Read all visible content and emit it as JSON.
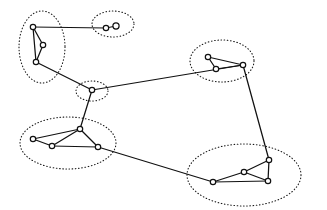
{
  "figure": {
    "title": "",
    "type": "cluster-graph-diagram",
    "width": 327,
    "height": 210,
    "background_color": "#ffffff",
    "stroke_color": "#111111",
    "node_fill_color": "#ffffff",
    "boundary_style": "dotted"
  },
  "clusters": [
    {
      "id": "cluster-top-left",
      "label": "",
      "cx": 42,
      "cy": 47,
      "rx": 23,
      "ry": 36,
      "rotation": 0,
      "node_count": 3
    },
    {
      "id": "cluster-top-pair",
      "label": "",
      "cx": 113,
      "cy": 24,
      "rx": 21,
      "ry": 13,
      "rotation": 0,
      "node_count": 2
    },
    {
      "id": "cluster-top-right",
      "label": "",
      "cx": 222,
      "cy": 61,
      "rx": 32,
      "ry": 21,
      "rotation": 0,
      "node_count": 3
    },
    {
      "id": "cluster-center",
      "label": "",
      "cx": 92,
      "cy": 91,
      "rx": 16,
      "ry": 10,
      "rotation": 0,
      "node_count": 1
    },
    {
      "id": "cluster-bottom-left",
      "label": "",
      "cx": 68,
      "cy": 143,
      "rx": 48,
      "ry": 26,
      "rotation": 0,
      "node_count": 4
    },
    {
      "id": "cluster-bottom-right",
      "label": "",
      "cx": 244,
      "cy": 175,
      "rx": 57,
      "ry": 31,
      "rotation": 0,
      "node_count": 4
    }
  ],
  "nodes": [
    {
      "id": "n1",
      "cluster": "cluster-top-left",
      "cx": 33,
      "cy": 27,
      "r": 2.7
    },
    {
      "id": "n2",
      "cluster": "cluster-top-left",
      "cx": 43,
      "cy": 45,
      "r": 2.7
    },
    {
      "id": "n3",
      "cluster": "cluster-top-left",
      "cx": 36,
      "cy": 62,
      "r": 2.7
    },
    {
      "id": "n4",
      "cluster": "cluster-top-pair",
      "cx": 106,
      "cy": 28,
      "r": 2.7
    },
    {
      "id": "n5",
      "cluster": "cluster-top-pair",
      "cx": 116,
      "cy": 26,
      "r": 3.1
    },
    {
      "id": "n6",
      "cluster": "cluster-top-right",
      "cx": 208,
      "cy": 57,
      "r": 2.7
    },
    {
      "id": "n7",
      "cluster": "cluster-top-right",
      "cx": 216,
      "cy": 69,
      "r": 2.7
    },
    {
      "id": "n8",
      "cluster": "cluster-top-right",
      "cx": 243,
      "cy": 65,
      "r": 2.7
    },
    {
      "id": "n9",
      "cluster": "cluster-center",
      "cx": 92,
      "cy": 90,
      "r": 2.7
    },
    {
      "id": "n10",
      "cluster": "cluster-bottom-left",
      "cx": 33,
      "cy": 139,
      "r": 2.7
    },
    {
      "id": "n11",
      "cluster": "cluster-bottom-left",
      "cx": 52,
      "cy": 146,
      "r": 2.7
    },
    {
      "id": "n12",
      "cluster": "cluster-bottom-left",
      "cx": 80,
      "cy": 129,
      "r": 2.7
    },
    {
      "id": "n13",
      "cluster": "cluster-bottom-left",
      "cx": 98,
      "cy": 147,
      "r": 2.7
    },
    {
      "id": "n14",
      "cluster": "cluster-bottom-right",
      "cx": 213,
      "cy": 182,
      "r": 2.7
    },
    {
      "id": "n15",
      "cluster": "cluster-bottom-right",
      "cx": 244,
      "cy": 172,
      "r": 2.7
    },
    {
      "id": "n16",
      "cluster": "cluster-bottom-right",
      "cx": 268,
      "cy": 181,
      "r": 2.7
    },
    {
      "id": "n17",
      "cluster": "cluster-bottom-right",
      "cx": 269,
      "cy": 160,
      "r": 2.7
    }
  ],
  "edges": [
    {
      "id": "e1",
      "from": "n1",
      "to": "n2",
      "kind": "intra"
    },
    {
      "id": "e2",
      "from": "n2",
      "to": "n3",
      "kind": "intra"
    },
    {
      "id": "e3",
      "from": "n1",
      "to": "n3",
      "kind": "intra"
    },
    {
      "id": "e4",
      "from": "n4",
      "to": "n5",
      "kind": "intra"
    },
    {
      "id": "e5",
      "from": "n6",
      "to": "n7",
      "kind": "intra"
    },
    {
      "id": "e6",
      "from": "n7",
      "to": "n8",
      "kind": "intra"
    },
    {
      "id": "e7",
      "from": "n6",
      "to": "n8",
      "kind": "intra"
    },
    {
      "id": "e8",
      "from": "n10",
      "to": "n11",
      "kind": "intra"
    },
    {
      "id": "e9",
      "from": "n11",
      "to": "n13",
      "kind": "intra"
    },
    {
      "id": "e10",
      "from": "n10",
      "to": "n12",
      "kind": "intra"
    },
    {
      "id": "e11",
      "from": "n11",
      "to": "n12",
      "kind": "intra"
    },
    {
      "id": "e12",
      "from": "n12",
      "to": "n13",
      "kind": "intra"
    },
    {
      "id": "e13",
      "from": "n14",
      "to": "n15",
      "kind": "intra"
    },
    {
      "id": "e14",
      "from": "n15",
      "to": "n16",
      "kind": "intra"
    },
    {
      "id": "e15",
      "from": "n14",
      "to": "n16",
      "kind": "intra"
    },
    {
      "id": "e16",
      "from": "n15",
      "to": "n17",
      "kind": "intra"
    },
    {
      "id": "e17",
      "from": "n16",
      "to": "n17",
      "kind": "intra"
    },
    {
      "id": "e18",
      "from": "n1",
      "to": "n4",
      "kind": "inter"
    },
    {
      "id": "e19",
      "from": "n3",
      "to": "n9",
      "kind": "inter"
    },
    {
      "id": "e20",
      "from": "n9",
      "to": "n8",
      "kind": "inter"
    },
    {
      "id": "e21",
      "from": "n9",
      "to": "n12",
      "kind": "inter"
    },
    {
      "id": "e22",
      "from": "n13",
      "to": "n14",
      "kind": "inter"
    },
    {
      "id": "e23",
      "from": "n8",
      "to": "n17",
      "kind": "inter"
    }
  ]
}
